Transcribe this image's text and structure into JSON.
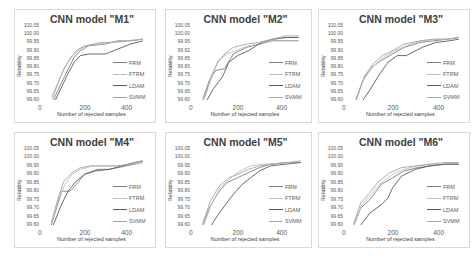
{
  "chart_data": [
    {
      "type": "line",
      "title": "CNN model \"M1\"",
      "xlabel": "Number of rejected samples",
      "ylabel": "Reliability",
      "xticks": [
        "0",
        "200",
        "400"
      ],
      "yticks": [
        "100.05",
        "100.00",
        "99.95",
        "99.90",
        "99.85",
        "99.80",
        "99.75",
        "99.70",
        "99.65",
        "99.60"
      ],
      "xlim": [
        0,
        500
      ],
      "ylim": [
        99.6,
        100.05
      ],
      "grid": false,
      "legend_position": "right",
      "series": [
        {
          "name": "FRM",
          "x": [
            50,
            80,
            110,
            150,
            180,
            220,
            300,
            360,
            420,
            480
          ],
          "y": [
            99.6,
            99.68,
            99.76,
            99.86,
            99.9,
            99.93,
            99.94,
            99.96,
            99.96,
            99.97
          ]
        },
        {
          "name": "FTRM",
          "x": [
            40,
            70,
            100,
            130,
            160,
            200,
            260,
            330,
            400,
            480
          ],
          "y": [
            99.62,
            99.7,
            99.79,
            99.85,
            99.89,
            99.93,
            99.94,
            99.95,
            99.96,
            99.97
          ]
        },
        {
          "name": "LDAM",
          "x": [
            60,
            90,
            120,
            150,
            180,
            220,
            300,
            360,
            420,
            480
          ],
          "y": [
            99.6,
            99.68,
            99.76,
            99.83,
            99.87,
            99.88,
            99.88,
            99.91,
            99.94,
            99.96
          ]
        },
        {
          "name": "SVMM",
          "x": [
            45,
            75,
            105,
            140,
            170,
            210,
            280,
            340,
            410,
            480
          ],
          "y": [
            99.61,
            99.71,
            99.8,
            99.87,
            99.91,
            99.93,
            99.95,
            99.95,
            99.96,
            99.97
          ]
        }
      ]
    },
    {
      "type": "line",
      "title": "CNN model \"M2\"",
      "xlabel": "Number of rejected samples",
      "ylabel": "Reliability",
      "xticks": [
        "0",
        "200",
        "400"
      ],
      "yticks": [
        "100.05",
        "100.00",
        "99.95",
        "99.92",
        "99.85",
        "99.80",
        "99.75",
        "99.70",
        "99.65",
        "99.60"
      ],
      "xlim": [
        0,
        500
      ],
      "ylim": [
        99.6,
        100.05
      ],
      "grid": false,
      "legend_position": "right",
      "series": [
        {
          "name": "FRM",
          "x": [
            40,
            70,
            100,
            140,
            180,
            240,
            300,
            360,
            420,
            480
          ],
          "y": [
            99.6,
            99.72,
            99.78,
            99.79,
            99.88,
            99.92,
            99.94,
            99.96,
            99.96,
            99.96
          ]
        },
        {
          "name": "FTRM",
          "x": [
            45,
            80,
            110,
            150,
            190,
            250,
            310,
            370,
            430,
            480
          ],
          "y": [
            99.6,
            99.73,
            99.84,
            99.88,
            99.9,
            99.93,
            99.94,
            99.97,
            99.98,
            99.98
          ]
        },
        {
          "name": "LDAM",
          "x": [
            60,
            90,
            130,
            160,
            200,
            250,
            310,
            360,
            420,
            480
          ],
          "y": [
            99.6,
            99.67,
            99.74,
            99.83,
            99.87,
            99.9,
            99.95,
            99.97,
            99.98,
            99.98
          ]
        },
        {
          "name": "SVMM",
          "x": [
            50,
            80,
            110,
            140,
            180,
            240,
            300,
            360,
            420,
            480
          ],
          "y": [
            99.62,
            99.75,
            99.83,
            99.88,
            99.92,
            99.94,
            99.95,
            99.97,
            99.99,
            99.99
          ]
        }
      ]
    },
    {
      "type": "line",
      "title": "CNN model \"M3\"",
      "xlabel": "Number of rejected samples",
      "ylabel": "Reliability",
      "xticks": [
        "0",
        "200",
        "400"
      ],
      "yticks": [
        "100.05",
        "100.00",
        "99.95",
        "99.90",
        "99.85",
        "99.80",
        "99.75",
        "99.70",
        "99.65",
        "99.60"
      ],
      "xlim": [
        0,
        500
      ],
      "ylim": [
        99.6,
        100.05
      ],
      "grid": false,
      "legend_position": "right",
      "series": [
        {
          "name": "FRM",
          "x": [
            40,
            70,
            110,
            150,
            200,
            250,
            320,
            380,
            440,
            490
          ],
          "y": [
            99.6,
            99.72,
            99.8,
            99.84,
            99.88,
            99.92,
            99.95,
            99.96,
            99.97,
            99.98
          ]
        },
        {
          "name": "FTRM",
          "x": [
            45,
            80,
            120,
            160,
            210,
            260,
            330,
            390,
            450,
            490
          ],
          "y": [
            99.62,
            99.75,
            99.81,
            99.86,
            99.9,
            99.93,
            99.96,
            99.97,
            99.97,
            99.98
          ]
        },
        {
          "name": "LDAM",
          "x": [
            70,
            100,
            140,
            180,
            220,
            260,
            330,
            390,
            450,
            490
          ],
          "y": [
            99.6,
            99.66,
            99.75,
            99.83,
            99.87,
            99.87,
            99.92,
            99.95,
            99.96,
            99.97
          ]
        },
        {
          "name": "SVMM",
          "x": [
            40,
            75,
            115,
            155,
            200,
            250,
            320,
            380,
            440,
            490
          ],
          "y": [
            99.61,
            99.74,
            99.82,
            99.87,
            99.9,
            99.94,
            99.96,
            99.97,
            99.97,
            99.98
          ]
        }
      ]
    },
    {
      "type": "line",
      "title": "CNN model \"M4\"",
      "xlabel": "Number of rejected samples",
      "ylabel": "Reliability",
      "xticks": [
        "0",
        "200",
        "400"
      ],
      "yticks": [
        "100.05",
        "100.00",
        "99.95",
        "99.90",
        "99.85",
        "99.80",
        "99.75",
        "99.70",
        "99.65",
        "99.60"
      ],
      "xlim": [
        0,
        500
      ],
      "ylim": [
        99.6,
        100.05
      ],
      "grid": false,
      "legend_position": "right",
      "series": [
        {
          "name": "FRM",
          "x": [
            40,
            70,
            90,
            130,
            160,
            200,
            260,
            320,
            400,
            480
          ],
          "y": [
            99.6,
            99.72,
            99.8,
            99.8,
            99.84,
            99.9,
            99.93,
            99.93,
            99.95,
            99.97
          ]
        },
        {
          "name": "FTRM",
          "x": [
            45,
            75,
            110,
            140,
            180,
            240,
            300,
            360,
            420,
            480
          ],
          "y": [
            99.62,
            99.76,
            99.85,
            99.9,
            99.93,
            99.95,
            99.95,
            99.95,
            99.96,
            99.97
          ]
        },
        {
          "name": "LDAM",
          "x": [
            50,
            85,
            120,
            160,
            200,
            250,
            320,
            380,
            440,
            480
          ],
          "y": [
            99.6,
            99.71,
            99.8,
            99.86,
            99.9,
            99.92,
            99.93,
            99.95,
            99.97,
            99.98
          ]
        },
        {
          "name": "SVMM",
          "x": [
            40,
            70,
            100,
            140,
            180,
            230,
            290,
            360,
            420,
            480
          ],
          "y": [
            99.61,
            99.75,
            99.86,
            99.91,
            99.94,
            99.95,
            99.95,
            99.95,
            99.96,
            99.98
          ]
        }
      ]
    },
    {
      "type": "line",
      "title": "CNN model \"M5\"",
      "xlabel": "Number of rejected samples",
      "ylabel": "Reliability",
      "xticks": [
        "0",
        "200",
        "400"
      ],
      "yticks": [
        "100.05",
        "100.00",
        "99.95",
        "99.90",
        "99.85",
        "99.80",
        "99.75",
        "99.70",
        "99.65",
        "99.60"
      ],
      "xlim": [
        0,
        500
      ],
      "ylim": [
        99.6,
        100.05
      ],
      "grid": false,
      "legend_position": "right",
      "series": [
        {
          "name": "FRM",
          "x": [
            40,
            70,
            110,
            150,
            200,
            250,
            300,
            350,
            420,
            490
          ],
          "y": [
            99.6,
            99.7,
            99.79,
            99.85,
            99.88,
            99.91,
            99.94,
            99.96,
            99.97,
            99.97
          ]
        },
        {
          "name": "FTRM",
          "x": [
            45,
            80,
            120,
            160,
            210,
            260,
            310,
            360,
            420,
            490
          ],
          "y": [
            99.6,
            99.72,
            99.82,
            99.87,
            99.92,
            99.95,
            99.96,
            99.96,
            99.97,
            99.97
          ]
        },
        {
          "name": "LDAM",
          "x": [
            80,
            110,
            150,
            180,
            220,
            260,
            300,
            350,
            420,
            490
          ],
          "y": [
            99.6,
            99.66,
            99.73,
            99.78,
            99.84,
            99.88,
            99.92,
            99.95,
            99.96,
            99.97
          ]
        },
        {
          "name": "SVMM",
          "x": [
            40,
            75,
            115,
            160,
            200,
            250,
            300,
            360,
            430,
            490
          ],
          "y": [
            99.61,
            99.74,
            99.83,
            99.88,
            99.9,
            99.93,
            99.95,
            99.96,
            99.97,
            99.98
          ]
        }
      ]
    },
    {
      "type": "line",
      "title": "CNN model \"M6\"",
      "xlabel": "Number of rejected samples",
      "ylabel": "Reliability",
      "xticks": [
        "0",
        "200",
        "400"
      ],
      "yticks": [
        "100.05",
        "100.00",
        "99.95",
        "99.90",
        "99.85",
        "99.80",
        "99.75",
        "99.70",
        "99.65",
        "99.60"
      ],
      "xlim": [
        0,
        500
      ],
      "ylim": [
        99.6,
        100.05
      ],
      "grid": false,
      "legend_position": "right",
      "series": [
        {
          "name": "FRM",
          "x": [
            30,
            60,
            100,
            150,
            200,
            250,
            310,
            370,
            430,
            490
          ],
          "y": [
            99.6,
            99.7,
            99.75,
            99.84,
            99.88,
            99.92,
            99.94,
            99.95,
            99.96,
            99.96
          ]
        },
        {
          "name": "FTRM",
          "x": [
            35,
            65,
            105,
            150,
            200,
            250,
            310,
            370,
            430,
            490
          ],
          "y": [
            99.61,
            99.72,
            99.78,
            99.85,
            99.9,
            99.93,
            99.95,
            99.96,
            99.96,
            99.96
          ]
        },
        {
          "name": "LDAM",
          "x": [
            60,
            100,
            150,
            180,
            200,
            240,
            300,
            360,
            430,
            490
          ],
          "y": [
            99.6,
            99.67,
            99.72,
            99.76,
            99.82,
            99.89,
            99.93,
            99.95,
            99.96,
            99.96
          ]
        },
        {
          "name": "SVMM",
          "x": [
            30,
            60,
            100,
            140,
            190,
            240,
            300,
            360,
            430,
            490
          ],
          "y": [
            99.61,
            99.73,
            99.79,
            99.86,
            99.91,
            99.94,
            99.95,
            99.96,
            99.97,
            99.97
          ]
        }
      ]
    }
  ],
  "series_colors": {
    "FRM": "#7f7f7f",
    "FTRM": "#bfbfbf",
    "LDAM": "#595959",
    "SVMM": "#a5a5a5"
  },
  "panels": [
    {
      "title": "CNN model \"M1\""
    },
    {
      "title": "CNN model \"M2\""
    },
    {
      "title": "CNN model \"M3\""
    },
    {
      "title": "CNN model \"M4\""
    },
    {
      "title": "CNN model \"M5\""
    },
    {
      "title": "CNN model \"M6\""
    }
  ]
}
